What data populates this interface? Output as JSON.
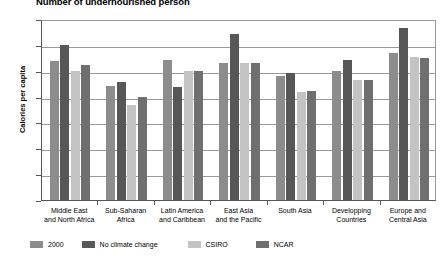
{
  "chart_data": {
    "type": "bar",
    "title": "Number of undernourished person",
    "xlabel": "",
    "ylabel": "Calories per capita",
    "ylim": [
      0,
      3500
    ],
    "ytick_step": 500,
    "yticks": [
      0,
      500,
      1000,
      1500,
      2000,
      2500,
      3000,
      3500
    ],
    "grid": true,
    "legend_position": "bottom",
    "categories": [
      "Middle East and North Africa",
      "Sub-Saharan Africa",
      "Latin America and Caribbean",
      "East Asia and the Pacific",
      "South Asia",
      "Developping Countries",
      "Europe and Central Asia"
    ],
    "category_lines": [
      [
        "Middle East",
        "and North Africa"
      ],
      [
        "Sub-Saharan",
        "Africa"
      ],
      [
        "Latin America",
        "and Caribbean"
      ],
      [
        "East Asia",
        "and the Pacific"
      ],
      [
        "South Asia",
        ""
      ],
      [
        "Developping",
        "Countries"
      ],
      [
        "Europe and",
        "Central Asia"
      ]
    ],
    "series": [
      {
        "name": "2000",
        "color": "#8c8c8c",
        "values": [
          2680,
          2200,
          2700,
          2650,
          2400,
          2500,
          2840
        ]
      },
      {
        "name": "No climate change",
        "color": "#575757",
        "values": [
          3000,
          2280,
          2180,
          3210,
          2450,
          2700,
          3330
        ]
      },
      {
        "name": "CSIRO",
        "color": "#c3c3c3",
        "values": [
          2500,
          1830,
          2500,
          2650,
          2080,
          2320,
          2760
        ]
      },
      {
        "name": "NCAR",
        "color": "#6f6f6f",
        "values": [
          2620,
          2000,
          2500,
          2650,
          2100,
          2330,
          2740
        ]
      }
    ]
  }
}
